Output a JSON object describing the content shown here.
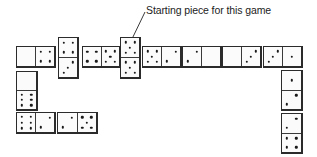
{
  "annotation": {
    "label": "Starting piece for this game",
    "points_to": "domino-starting-piece"
  },
  "pip_color": "#1a1a1a",
  "outline_color": "#2b2b2b",
  "dominoes": [
    {
      "id": "top-1",
      "orientation": "h",
      "x": 16,
      "y": 46,
      "w": 40,
      "h": 22,
      "ends": [
        0,
        4
      ]
    },
    {
      "id": "top-2",
      "orientation": "v",
      "x": 58,
      "y": 37,
      "w": 21,
      "h": 42,
      "ends": [
        4,
        3
      ]
    },
    {
      "id": "top-3",
      "orientation": "h",
      "x": 82,
      "y": 46,
      "w": 39,
      "h": 22,
      "ends": [
        4,
        5
      ]
    },
    {
      "id": "starting-piece",
      "orientation": "v",
      "x": 120,
      "y": 37,
      "w": 21,
      "h": 42,
      "ends": [
        5,
        5
      ],
      "starting": true
    },
    {
      "id": "top-5",
      "orientation": "h",
      "x": 142,
      "y": 46,
      "w": 40,
      "h": 22,
      "ends": [
        5,
        2
      ]
    },
    {
      "id": "top-6",
      "orientation": "h",
      "x": 182,
      "y": 46,
      "w": 40,
      "h": 22,
      "ends": [
        2,
        0
      ]
    },
    {
      "id": "top-7",
      "orientation": "h",
      "x": 222,
      "y": 46,
      "w": 40,
      "h": 22,
      "ends": [
        0,
        3
      ]
    },
    {
      "id": "top-8",
      "orientation": "h",
      "x": 263,
      "y": 46,
      "w": 40,
      "h": 22,
      "ends": [
        3,
        1
      ]
    },
    {
      "id": "right-1",
      "orientation": "v",
      "x": 281,
      "y": 70,
      "w": 22,
      "h": 41,
      "ends": [
        1,
        2
      ]
    },
    {
      "id": "right-2",
      "orientation": "v",
      "x": 281,
      "y": 113,
      "w": 22,
      "h": 41,
      "ends": [
        2,
        4
      ]
    },
    {
      "id": "left-1",
      "orientation": "v",
      "x": 16,
      "y": 71,
      "w": 22,
      "h": 40,
      "ends": [
        0,
        6
      ]
    },
    {
      "id": "bottom-1",
      "orientation": "h",
      "x": 16,
      "y": 112,
      "w": 40,
      "h": 22,
      "ends": [
        6,
        2
      ]
    },
    {
      "id": "bottom-2",
      "orientation": "h",
      "x": 57,
      "y": 112,
      "w": 41,
      "h": 22,
      "ends": [
        2,
        5
      ]
    }
  ]
}
